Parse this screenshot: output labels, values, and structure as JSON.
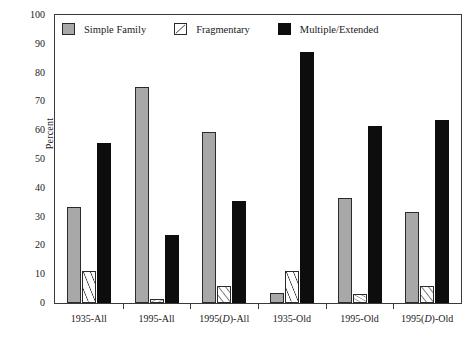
{
  "chart_data": {
    "type": "bar",
    "title": "",
    "xlabel": "",
    "ylabel": "Percent",
    "ylim": [
      0,
      100
    ],
    "yticks": [
      0,
      10,
      20,
      30,
      40,
      50,
      60,
      70,
      80,
      90,
      100
    ],
    "ytick_labels": [
      "0",
      "10",
      "20",
      "30",
      "40",
      "50",
      "60",
      "70",
      "80",
      "90",
      "100"
    ],
    "grid": false,
    "legend_position": "upper-left-inside",
    "categories": [
      "1935-All",
      "1995-All",
      "1995(D)-All",
      "1935-Old",
      "1995-Old",
      "1995(D)-Old"
    ],
    "category_labels_html": [
      "1935-All",
      "1995-All",
      "1995(<i>D</i>)-All",
      "1935-Old",
      "1995-Old",
      "1995(<i>D</i>)-Old"
    ],
    "series": [
      {
        "name": "Simple Family",
        "color": "#a8a8a8",
        "pattern": "solid-gray",
        "values": [
          33.5,
          75.0,
          59.5,
          3.5,
          36.5,
          31.5
        ]
      },
      {
        "name": "Fragmentary",
        "color": "#ffffff",
        "pattern": "forward-diagonal-hatch",
        "values": [
          11.0,
          1.5,
          6.0,
          11.0,
          3.0,
          6.0
        ]
      },
      {
        "name": "Multiple/Extended",
        "color": "#0d0d0d",
        "pattern": "solid-black",
        "values": [
          55.5,
          23.5,
          35.5,
          87.0,
          61.5,
          63.5
        ]
      }
    ]
  },
  "legend": {
    "entries": [
      {
        "label": "Simple Family"
      },
      {
        "label": "Fragmentary"
      },
      {
        "label": "Multiple/Extended"
      }
    ]
  },
  "axes": {
    "y_title": "Percent"
  }
}
